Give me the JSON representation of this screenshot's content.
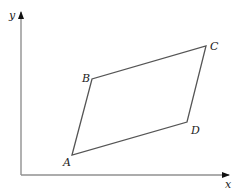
{
  "diagram": {
    "type": "coordinate-parallelogram",
    "axes": {
      "x_label": "x",
      "y_label": "y",
      "color": "#808080"
    },
    "shape_color": "#555555",
    "vertices": [
      {
        "label": "A",
        "x": 72,
        "y": 155,
        "label_x": 63,
        "label_y": 166
      },
      {
        "label": "B",
        "x": 92,
        "y": 79,
        "label_x": 82,
        "label_y": 82
      },
      {
        "label": "C",
        "x": 206,
        "y": 46,
        "label_x": 210,
        "label_y": 50
      },
      {
        "label": "D",
        "x": 187,
        "y": 122,
        "label_x": 191,
        "label_y": 134
      }
    ]
  }
}
